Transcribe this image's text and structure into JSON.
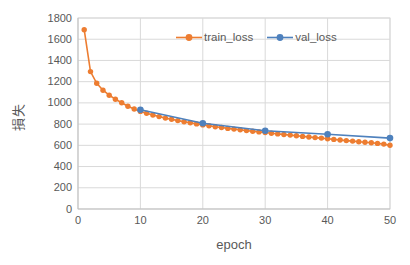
{
  "chart": {
    "y_axis_title": "損失",
    "x_axis_title": "epoch"
  },
  "colors": {
    "grid": "#D9D9D9",
    "axis": "#BFBFBF",
    "text": "#595959",
    "background": "#FFFFFF"
  },
  "chart_data": {
    "type": "line",
    "title": "",
    "xlabel": "epoch",
    "ylabel": "損失",
    "xlim": [
      0,
      50
    ],
    "ylim": [
      0,
      1800
    ],
    "x_ticks": [
      0,
      10,
      20,
      30,
      40,
      50
    ],
    "y_ticks": [
      0,
      200,
      400,
      600,
      800,
      1000,
      1200,
      1400,
      1600,
      1800
    ],
    "grid": true,
    "legend_position": "top-center-inside",
    "series": [
      {
        "name": "train_loss",
        "color": "#ED7D31",
        "x": [
          1,
          2,
          3,
          4,
          5,
          6,
          7,
          8,
          9,
          10,
          11,
          12,
          13,
          14,
          15,
          16,
          17,
          18,
          19,
          20,
          21,
          22,
          23,
          24,
          25,
          26,
          27,
          28,
          29,
          30,
          31,
          32,
          33,
          34,
          35,
          36,
          37,
          38,
          39,
          40,
          41,
          42,
          43,
          44,
          45,
          46,
          47,
          48,
          49,
          50
        ],
        "y": [
          1690,
          1295,
          1185,
          1120,
          1072,
          1035,
          1002,
          968,
          942,
          920,
          902,
          886,
          871,
          857,
          845,
          833,
          822,
          812,
          802,
          793,
          784,
          776,
          768,
          760,
          753,
          746,
          739,
          733,
          727,
          721,
          714,
          708,
          702,
          696,
          690,
          684,
          679,
          673,
          668,
          662,
          656,
          650,
          645,
          640,
          634,
          629,
          624,
          618,
          612,
          600
        ]
      },
      {
        "name": "val_loss",
        "color": "#4E81BD",
        "x": [
          10,
          20,
          30,
          40,
          50
        ],
        "y": [
          935,
          808,
          738,
          705,
          668
        ]
      }
    ]
  }
}
